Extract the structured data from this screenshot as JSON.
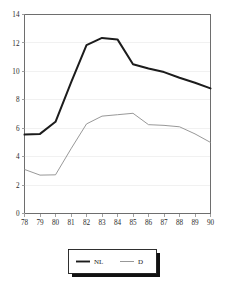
{
  "chart_data": {
    "type": "line",
    "title": "",
    "subtitle": "",
    "xlabel": "",
    "ylabel": "",
    "xlim": [
      78,
      90
    ],
    "ylim": [
      0,
      14
    ],
    "grid": true,
    "legend_position": "bottom-center",
    "x": [
      78,
      79,
      80,
      81,
      82,
      83,
      84,
      85,
      86,
      87,
      88,
      89,
      90
    ],
    "xtick_labels": [
      "78",
      "79",
      "80",
      "81",
      "82",
      "83",
      "84",
      "85",
      "86",
      "87",
      "88",
      "89",
      "90"
    ],
    "ytick_labels": [
      "0",
      "2",
      "4",
      "6",
      "8",
      "10",
      "12",
      "14"
    ],
    "ytick_values": [
      0,
      2,
      4,
      6,
      8,
      10,
      12,
      14
    ],
    "series": [
      {
        "name": "NL",
        "color": "#1c1c1c",
        "width": "thick",
        "values": [
          5.55,
          5.6,
          6.45,
          9.2,
          11.85,
          12.35,
          12.25,
          10.5,
          10.2,
          9.95,
          9.55,
          9.2,
          8.8
        ]
      },
      {
        "name": "D",
        "color": "#8c8c8c",
        "width": "thin",
        "values": [
          3.1,
          2.7,
          2.72,
          4.55,
          6.3,
          6.85,
          6.95,
          7.05,
          6.25,
          6.2,
          6.1,
          5.6,
          5.0
        ]
      }
    ],
    "legend": [
      {
        "label": "NL",
        "color": "#1c1c1c",
        "width": "thick"
      },
      {
        "label": "D",
        "color": "#8c8c8c",
        "width": "thin"
      }
    ]
  }
}
